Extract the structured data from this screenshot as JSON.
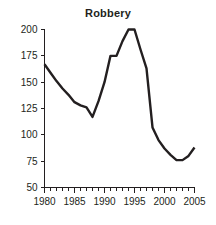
{
  "chart_data": {
    "type": "line",
    "title": "Robbery",
    "xlabel": "",
    "ylabel": "",
    "x": [
      1980,
      1981,
      1982,
      1983,
      1984,
      1985,
      1986,
      1987,
      1988,
      1989,
      1990,
      1991,
      1992,
      1993,
      1994,
      1995,
      1996,
      1997,
      1998,
      1999,
      2000,
      2001,
      2002,
      2003,
      2004,
      2005
    ],
    "values": [
      167,
      159,
      151,
      144,
      138,
      131,
      128,
      126,
      117,
      132,
      150,
      175,
      175,
      189,
      200,
      200,
      181,
      163,
      107,
      95,
      87,
      81,
      76,
      76,
      80,
      88
    ],
    "series": [
      {
        "name": "Robbery",
        "values": [
          167,
          159,
          151,
          144,
          138,
          131,
          128,
          126,
          117,
          132,
          150,
          175,
          175,
          189,
          200,
          200,
          181,
          163,
          107,
          95,
          87,
          81,
          76,
          76,
          80,
          88
        ]
      }
    ],
    "xlim": [
      1980,
      2005
    ],
    "ylim": [
      50,
      200
    ],
    "y_ticks": [
      50,
      75,
      100,
      125,
      150,
      175,
      200
    ],
    "y_tick_labels": [
      "50",
      "75",
      "100",
      "125",
      "150",
      "175",
      "200"
    ],
    "x_ticks": [
      1980,
      1985,
      1990,
      1995,
      2000,
      2005
    ],
    "x_tick_labels": [
      "1980",
      "1985",
      "1990",
      "1995",
      "2000",
      "2005"
    ],
    "x_minor_tick_interval": 1,
    "grid": false,
    "legend": false,
    "line_color": "#231f20",
    "axis_color": "#231f20",
    "background_color": "#ffffff"
  }
}
